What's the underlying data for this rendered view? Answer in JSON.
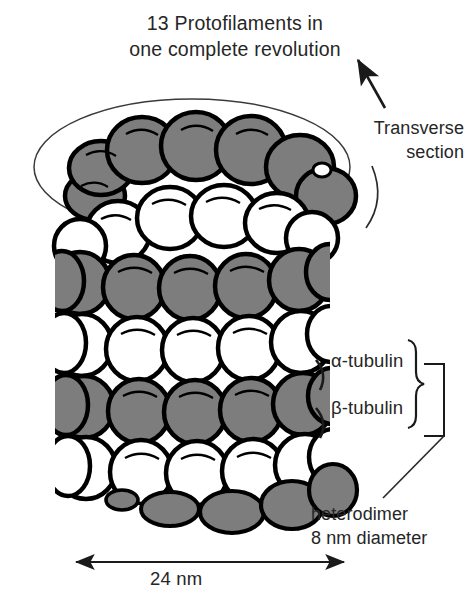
{
  "figure": {
    "kind": "microtubule-structure-diagram",
    "title_line1": "13 Protofilaments in",
    "title_line2": "one complete revolution",
    "annotations": {
      "transverse_line1": "Transverse",
      "transverse_line2": "section",
      "alpha_tubulin": "α-tubulin",
      "beta_tubulin": "β-tubulin",
      "heterodimer_line1": "heterodimer",
      "heterodimer_line2": "8 nm diameter",
      "diameter_dimension": "24 nm"
    },
    "colors": {
      "alpha_subunit_fill": "#7d7d7d",
      "beta_subunit_fill": "#ffffff",
      "outline": "#000000",
      "text": "#262626",
      "background": "#ffffff",
      "ellipse_stroke": "#3a3a3a"
    },
    "structure": {
      "protofilament_count": 13,
      "cylinder_diameter_nm": 24,
      "heterodimer_diameter_nm": 8,
      "subunit_order": [
        "α-tubulin",
        "β-tubulin"
      ]
    }
  }
}
